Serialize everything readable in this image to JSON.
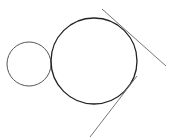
{
  "diagram": {
    "width": 170,
    "height": 140,
    "background": "#ffffff",
    "small_circle": {
      "cx": 29,
      "cy": 64,
      "r": 22,
      "stroke": "#555555",
      "stroke_width": 1
    },
    "large_circle": {
      "cx": 94,
      "cy": 61,
      "r": 43,
      "stroke": "#222222",
      "stroke_width": 1.3
    },
    "tangent_lines": [
      {
        "name": "upper-tangent",
        "x1": 102,
        "y1": 9,
        "x2": 166,
        "y2": 66,
        "stroke": "#777777",
        "stroke_width": 1
      },
      {
        "name": "lower-tangent",
        "x1": 90,
        "y1": 137,
        "x2": 137,
        "y2": 76,
        "stroke": "#777777",
        "stroke_width": 1
      }
    ]
  }
}
